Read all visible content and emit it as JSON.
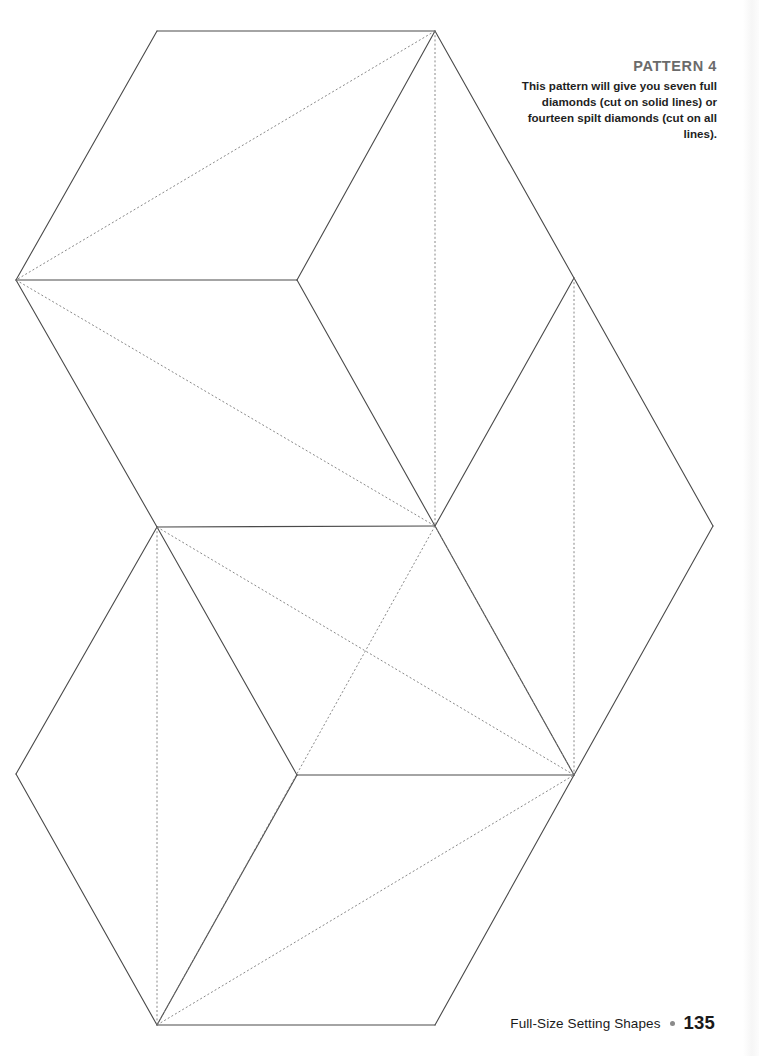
{
  "page": {
    "width": 759,
    "height": 1056,
    "background": "#ffffff"
  },
  "caption": {
    "title": "PATTERN 4",
    "body": "This pattern will give you seven full diamonds (cut on solid lines) or fourteen spilt diamonds (cut on all lines).",
    "title_color": "#6b6b6b",
    "body_color": "#1f1f1f"
  },
  "footer": {
    "label": "Full-Size Setting Shapes",
    "bullet": "bullet-dot",
    "page_number": "135",
    "bullet_color": "#8a8a8a"
  },
  "diagram": {
    "solid_line_color": "#4a4a4a",
    "dashed_line_color": "#7a7a7a",
    "solid_stroke_width": 1.1,
    "dashed_stroke_width": 0.9,
    "dash_pattern": "2,2.2",
    "vertices": {
      "top_hex_top_left": [
        157,
        31
      ],
      "top_hex_top_right": [
        435,
        31
      ],
      "top_hex_left": [
        16,
        280
      ],
      "center_upper": [
        297,
        280
      ],
      "right_upper": [
        574,
        278
      ],
      "center_main": [
        435,
        526
      ],
      "left_mid": [
        157,
        527
      ],
      "right_mid": [
        713,
        526
      ],
      "center_lower": [
        297,
        775
      ],
      "right_lower": [
        574,
        775
      ],
      "bottom_left": [
        16,
        774
      ],
      "bottom_vertex": [
        157,
        1025
      ],
      "bottom_right": [
        435,
        1025
      ]
    },
    "solid_edges": [
      [
        [
          157,
          31
        ],
        [
          435,
          31
        ]
      ],
      [
        [
          157,
          31
        ],
        [
          16,
          280
        ]
      ],
      [
        [
          16,
          280
        ],
        [
          297,
          280
        ]
      ],
      [
        [
          435,
          31
        ],
        [
          297,
          280
        ]
      ],
      [
        [
          435,
          31
        ],
        [
          574,
          278
        ]
      ],
      [
        [
          574,
          278
        ],
        [
          435,
          526
        ]
      ],
      [
        [
          297,
          280
        ],
        [
          435,
          526
        ]
      ],
      [
        [
          16,
          280
        ],
        [
          157,
          527
        ]
      ],
      [
        [
          157,
          527
        ],
        [
          435,
          526
        ]
      ],
      [
        [
          574,
          278
        ],
        [
          713,
          526
        ]
      ],
      [
        [
          713,
          526
        ],
        [
          574,
          775
        ]
      ],
      [
        [
          435,
          526
        ],
        [
          574,
          775
        ]
      ],
      [
        [
          157,
          527
        ],
        [
          297,
          775
        ]
      ],
      [
        [
          297,
          775
        ],
        [
          574,
          775
        ]
      ],
      [
        [
          157,
          527
        ],
        [
          16,
          774
        ]
      ],
      [
        [
          16,
          774
        ],
        [
          157,
          1025
        ]
      ],
      [
        [
          157,
          1025
        ],
        [
          297,
          775
        ]
      ],
      [
        [
          157,
          1025
        ],
        [
          435,
          1025
        ]
      ],
      [
        [
          435,
          1025
        ],
        [
          574,
          775
        ]
      ]
    ],
    "dashed_edges": [
      [
        [
          435,
          31
        ],
        [
          16,
          280
        ]
      ],
      [
        [
          435,
          31
        ],
        [
          435,
          526
        ]
      ],
      [
        [
          16,
          280
        ],
        [
          435,
          526
        ]
      ],
      [
        [
          574,
          278
        ],
        [
          574,
          526
        ]
      ],
      [
        [
          574,
          526
        ],
        [
          574,
          775
        ]
      ],
      [
        [
          157,
          527
        ],
        [
          157,
          1025
        ]
      ],
      [
        [
          435,
          526
        ],
        [
          157,
          1025
        ]
      ],
      [
        [
          157,
          527
        ],
        [
          574,
          775
        ]
      ],
      [
        [
          435,
          526
        ],
        [
          574,
          775
        ]
      ],
      [
        [
          157,
          1025
        ],
        [
          574,
          775
        ]
      ]
    ]
  }
}
